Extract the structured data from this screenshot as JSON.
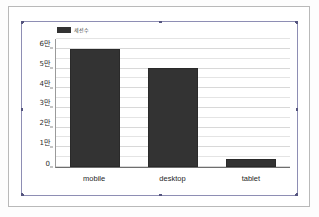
{
  "chart_data": {
    "type": "bar",
    "title": "",
    "xlabel": "",
    "ylabel": "",
    "categories": [
      "mobile",
      "desktop",
      "tablet"
    ],
    "values": [
      60000,
      50500,
      4000
    ],
    "series": [
      {
        "name": "세션수",
        "values": [
          60000,
          50500,
          4000
        ]
      }
    ],
    "ylim": [
      0,
      65000
    ],
    "ytick_values": [
      0,
      10000,
      20000,
      30000,
      40000,
      50000,
      60000
    ],
    "ytick_labels": [
      "0",
      "1만",
      "2만",
      "3만",
      "4만",
      "5만",
      "6만"
    ],
    "grid": true,
    "minor_gridlines": true,
    "legend_position": "top-left",
    "bar_color": "#333333"
  },
  "legend": {
    "label": "세션수",
    "swatch_color": "#333333"
  },
  "axes": {
    "y_ticks": [
      {
        "label": "6만",
        "value": 60000
      },
      {
        "label": "5만",
        "value": 50000
      },
      {
        "label": "4만",
        "value": 40000
      },
      {
        "label": "3만",
        "value": 30000
      },
      {
        "label": "2만",
        "value": 20000
      },
      {
        "label": "1만",
        "value": 10000
      },
      {
        "label": "0",
        "value": 0
      }
    ],
    "x_labels": [
      "mobile",
      "desktop",
      "tablet"
    ]
  },
  "selection": {
    "handle_color": "#55557f",
    "border_color": "#8e8eb4"
  }
}
